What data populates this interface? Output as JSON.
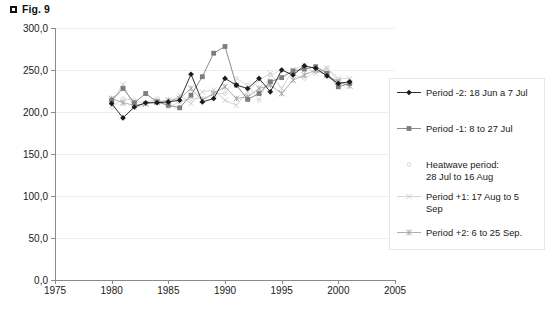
{
  "figure": {
    "bullet_icon": "black-square-icon",
    "title": "Fig. 9"
  },
  "legend": {
    "items": [
      {
        "label": "Period -2: 18 Jun a 7 Jul",
        "marker": "diamond",
        "color": "#1a1a1a"
      },
      {
        "label": "Period -1:   8 to 27 Jul",
        "marker": "square",
        "color": "#7d7d7d"
      },
      {
        "label": "Heatwave period:\n28 Jul to 16 Aug",
        "marker": "dot",
        "color": "#d9d9d9"
      },
      {
        "label": "Period +1: 17 Aug to 5\nSep",
        "marker": "cross",
        "color": "#cfcfcf"
      },
      {
        "label": "Period +2:   6 to 25 Sep.",
        "marker": "asterisk",
        "color": "#a6a6a6"
      }
    ]
  },
  "chart_data": {
    "type": "line",
    "title": "Fig. 9",
    "xlabel": "",
    "ylabel": "",
    "xlim": [
      1975,
      2005
    ],
    "ylim": [
      0,
      300
    ],
    "xticks": [
      1975,
      1980,
      1985,
      1990,
      1995,
      2000,
      2005
    ],
    "yticks": [
      0,
      50,
      100,
      150,
      200,
      250,
      300
    ],
    "ytick_labels": [
      "0,0",
      "50,0",
      "100,0",
      "150,0",
      "200,0",
      "250,0",
      "300,0"
    ],
    "xtick_labels": [
      "1975",
      "1980",
      "1985",
      "1990",
      "1995",
      "2000",
      "2005"
    ],
    "grid": true,
    "legend_position": "right",
    "x": [
      1980,
      1981,
      1982,
      1983,
      1984,
      1985,
      1986,
      1987,
      1988,
      1989,
      1990,
      1991,
      1992,
      1993,
      1994,
      1995,
      1996,
      1997,
      1998,
      1999,
      2000,
      2001
    ],
    "series": [
      {
        "name": "Period -2: 18 Jun a 7 Jul",
        "marker": "diamond",
        "color": "#1a1a1a",
        "values": [
          210,
          193,
          206,
          211,
          211,
          212,
          214,
          245,
          212,
          216,
          240,
          232,
          228,
          240,
          224,
          250,
          244,
          255,
          252,
          243,
          234,
          236
        ]
      },
      {
        "name": "Period -1:   8 to 27 Jul",
        "marker": "square",
        "color": "#7d7d7d",
        "values": [
          214,
          228,
          211,
          222,
          212,
          208,
          205,
          220,
          242,
          270,
          278,
          232,
          215,
          222,
          236,
          241,
          249,
          251,
          254,
          246,
          230,
          234
        ]
      },
      {
        "name": "Heatwave period: 28 Jul to 16 Aug",
        "marker": "dot",
        "color": "#d9d9d9",
        "values": [
          206,
          216,
          214,
          210,
          216,
          206,
          212,
          216,
          216,
          222,
          222,
          240,
          232,
          214,
          244,
          250,
          244,
          240,
          248,
          252,
          237,
          233
        ]
      },
      {
        "name": "Period +1: 17 Aug to 5 Sep",
        "marker": "cross",
        "color": "#cfcfcf",
        "values": [
          212,
          233,
          205,
          209,
          214,
          210,
          220,
          210,
          224,
          226,
          214,
          208,
          224,
          238,
          246,
          228,
          250,
          256,
          246,
          252,
          240,
          240
        ]
      },
      {
        "name": "Period +2:   6 to 25 Sep.",
        "marker": "asterisk",
        "color": "#a6a6a6",
        "values": [
          216,
          211,
          208,
          210,
          212,
          214,
          216,
          228,
          214,
          222,
          230,
          216,
          218,
          228,
          232,
          222,
          238,
          244,
          250,
          244,
          236,
          231
        ]
      }
    ]
  }
}
